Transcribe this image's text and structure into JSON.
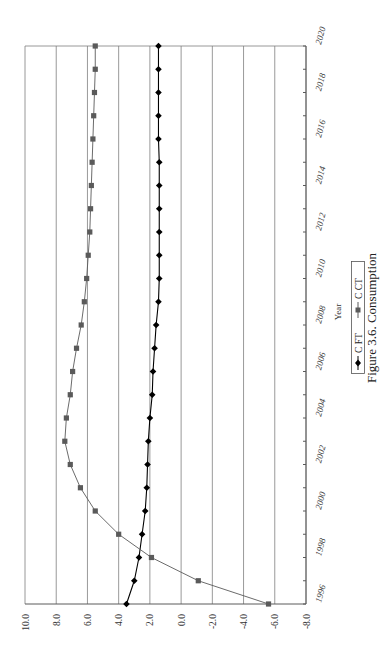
{
  "chart_data": {
    "type": "line",
    "title": "",
    "caption": "Figure 3.6.  Consumption",
    "xlabel": "Year",
    "ylabel": "",
    "orientation": "rotated-90-ccw",
    "x": [
      1996,
      1997,
      1998,
      1999,
      2000,
      2001,
      2002,
      2003,
      2004,
      2005,
      2006,
      2007,
      2008,
      2009,
      2010,
      2011,
      2012,
      2013,
      2014,
      2015,
      2016,
      2017,
      2018,
      2019,
      2020
    ],
    "x_tick_labels": [
      "1996",
      "1998",
      "2000",
      "2002",
      "2004",
      "2006",
      "2008",
      "2010",
      "2012",
      "2014",
      "2016",
      "2018",
      "2020"
    ],
    "y_tick_labels": [
      "10.0",
      "8.0",
      "6.0",
      "4.0",
      "2.0",
      "0.0",
      "-2.0",
      "-4.0",
      "-6.0",
      "-8.0"
    ],
    "y_ticks": [
      10,
      8,
      6,
      4,
      2,
      0,
      -2,
      -4,
      -6,
      -8
    ],
    "ylim": [
      -8,
      10
    ],
    "grid": true,
    "legend_position": "bottom",
    "series": [
      {
        "name": "C FT",
        "marker": "diamond",
        "color": "#000000",
        "values": [
          3.5,
          3.0,
          2.7,
          2.5,
          2.3,
          2.2,
          2.15,
          2.1,
          2.0,
          1.85,
          1.8,
          1.7,
          1.6,
          1.45,
          1.4,
          1.4,
          1.4,
          1.4,
          1.4,
          1.4,
          1.45,
          1.45,
          1.45,
          1.45,
          1.45
        ]
      },
      {
        "name": "C CT",
        "marker": "square",
        "color": "#5a5a5a",
        "values": [
          -5.6,
          -1.1,
          1.9,
          4.0,
          5.5,
          6.45,
          7.1,
          7.45,
          7.35,
          7.1,
          6.95,
          6.7,
          6.4,
          6.2,
          6.05,
          5.95,
          5.85,
          5.8,
          5.75,
          5.7,
          5.65,
          5.6,
          5.55,
          5.5,
          5.5
        ]
      }
    ]
  },
  "legend": {
    "items": [
      {
        "label": "C FT"
      },
      {
        "label": "C CT"
      }
    ]
  },
  "colors": {
    "grid": "#7f7f7f",
    "series_ft": "#000000",
    "series_ct": "#5a5a5a"
  }
}
